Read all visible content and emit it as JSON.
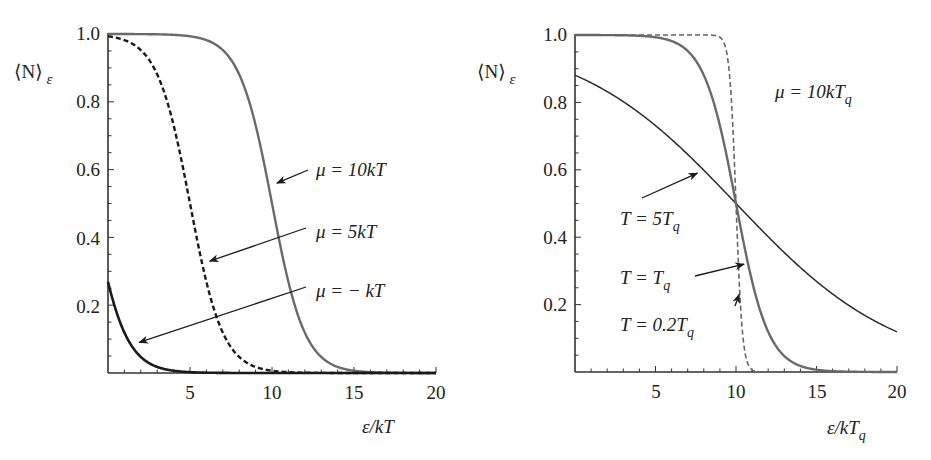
{
  "chart_data": [
    {
      "type": "line",
      "title": "",
      "xlabel": "ε/kT",
      "ylabel": "⟨N⟩_ε",
      "xlim": [
        0,
        20
      ],
      "ylim": [
        0,
        1
      ],
      "xticks": [
        5,
        10,
        15,
        20
      ],
      "yticks": [
        0.2,
        0.4,
        0.6,
        0.8,
        1.0
      ],
      "grid": false,
      "function": "1/(exp(ε - μ)/kT + 1)",
      "series": [
        {
          "name": "μ = 10kT",
          "mu": 10,
          "T": 1,
          "style": "solid-gray",
          "x": [
            0,
            2,
            4,
            6,
            8,
            9,
            10,
            11,
            12,
            14,
            16,
            18,
            20
          ],
          "values": [
            1.0,
            1.0,
            0.998,
            0.982,
            0.881,
            0.731,
            0.5,
            0.269,
            0.119,
            0.018,
            0.002,
            0.0,
            0.0
          ]
        },
        {
          "name": "μ = 5kT",
          "mu": 5,
          "T": 1,
          "style": "dashed-black",
          "x": [
            0,
            1,
            2,
            3,
            4,
            5,
            6,
            7,
            8,
            10,
            12
          ],
          "values": [
            0.993,
            0.982,
            0.953,
            0.881,
            0.731,
            0.5,
            0.269,
            0.119,
            0.047,
            0.007,
            0.001
          ]
        },
        {
          "name": "μ = − kT",
          "mu": -1,
          "T": 1,
          "style": "solid-black",
          "x": [
            0,
            1,
            2,
            3,
            4,
            5
          ],
          "values": [
            0.269,
            0.119,
            0.047,
            0.018,
            0.007,
            0.002
          ]
        }
      ],
      "annotations": [
        {
          "text": "μ = 10kT",
          "arrow_to": [
            10.3,
            0.56
          ]
        },
        {
          "text": "μ = 5kT",
          "arrow_to": [
            6.2,
            0.33
          ]
        },
        {
          "text": "μ = − kT",
          "arrow_to": [
            1.9,
            0.09
          ]
        }
      ]
    },
    {
      "type": "line",
      "title": "",
      "xlabel": "ε/kT_q",
      "ylabel": "⟨N⟩_ε",
      "xlim": [
        0,
        20
      ],
      "ylim": [
        0,
        1
      ],
      "xticks": [
        5,
        10,
        15,
        20
      ],
      "yticks": [
        0.2,
        0.4,
        0.6,
        0.8,
        1.0
      ],
      "grid": false,
      "function": "1/(exp((ε - μ)/kT) + 1), μ = 10kT_q",
      "series": [
        {
          "name": "T = 5T_q",
          "mu": 10,
          "T": 5,
          "style": "solid-black-thin",
          "x": [
            0,
            2,
            4,
            6,
            8,
            10,
            12,
            14,
            16,
            18,
            20
          ],
          "values": [
            0.881,
            0.832,
            0.769,
            0.69,
            0.599,
            0.5,
            0.401,
            0.31,
            0.231,
            0.168,
            0.119
          ]
        },
        {
          "name": "T = T_q",
          "mu": 10,
          "T": 1,
          "style": "solid-gray",
          "x": [
            0,
            4,
            6,
            8,
            9,
            10,
            11,
            12,
            14,
            16,
            20
          ],
          "values": [
            1.0,
            0.998,
            0.982,
            0.881,
            0.731,
            0.5,
            0.269,
            0.119,
            0.018,
            0.002,
            0.0
          ]
        },
        {
          "name": "T = 0.2T_q",
          "mu": 10,
          "T": 0.2,
          "style": "dashed-gray",
          "x": [
            0,
            9,
            9.5,
            10,
            10.5,
            11,
            20
          ],
          "values": [
            1.0,
            0.993,
            0.924,
            0.5,
            0.076,
            0.007,
            0.0
          ]
        }
      ],
      "annotations": [
        {
          "text": "μ = 10kT_q"
        },
        {
          "text": "T = 5T_q",
          "arrow_to": [
            7.6,
            0.59
          ]
        },
        {
          "text": "T = T_q",
          "arrow_to": [
            10.5,
            0.32
          ]
        },
        {
          "text": "T = 0.2T_q",
          "arrow_to": [
            10.2,
            0.23
          ]
        }
      ]
    }
  ],
  "left": {
    "ylabel_main": "⟨N⟩",
    "ylabel_sub": "ε",
    "xlabel": "ε/kT",
    "yticks": [
      "0.2",
      "0.4",
      "0.6",
      "0.8",
      "1.0"
    ],
    "xticks": [
      "5",
      "10",
      "15",
      "20"
    ],
    "labels": {
      "mu10": "μ = 10kT",
      "mu5": "μ = 5kT",
      "mum1": "μ = − kT"
    }
  },
  "right": {
    "ylabel_main": "⟨N⟩",
    "ylabel_sub": "ε",
    "xlabel_main": "ε/kT",
    "xlabel_sub": "q",
    "yticks": [
      "0.2",
      "0.4",
      "0.6",
      "0.8",
      "1.0"
    ],
    "xticks": [
      "5",
      "10",
      "15",
      "20"
    ],
    "labels": {
      "mu_main": "μ = 10kT",
      "mu_sub": "q",
      "t5_main": "T = 5T",
      "t5_sub": "q",
      "t1_main": "T = T",
      "t1_sub": "q",
      "t02_main": "T = 0.2T",
      "t02_sub": "q"
    }
  },
  "colors": {
    "axis": "#333333",
    "black_curve": "#1a1a1a",
    "gray_curve": "#666666",
    "text": "#222222"
  }
}
